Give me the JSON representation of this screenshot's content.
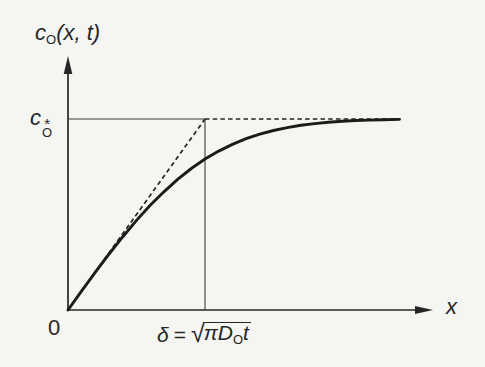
{
  "figure": {
    "colors": {
      "background": "#f5f5f2",
      "ink": "#262626",
      "thin_line": "#3d3d3d"
    }
  },
  "labels": {
    "y_axis": {
      "base": "c",
      "sub": "O",
      "args": "(x, t)"
    },
    "cstar": {
      "base": "c",
      "sup": "*",
      "sub": "O"
    },
    "origin": "0",
    "x_axis": "x",
    "delta": {
      "symbol": "δ",
      "equals": "=",
      "radical_sign": "√",
      "radicand_pre": "πD",
      "radicand_sub": "O",
      "radicand_post": "t"
    }
  },
  "chart_data": {
    "type": "line",
    "title": "",
    "xlabel": "x",
    "ylabel": "c_O(x, t)",
    "x_axis_units": "distance from electrode, in multiples of δ = √(πD_O t)",
    "y_axis_units": "concentration, fraction of bulk value c_O*",
    "xlim": [
      0,
      2.42
    ],
    "ylim": [
      0,
      1
    ],
    "grid": false,
    "legend": "none",
    "annotations": {
      "y_reference_level": {
        "label": "c_O*",
        "y": 1
      },
      "x_reference_level": {
        "label": "δ = √(πD_O t)",
        "x": 1
      }
    },
    "series": [
      {
        "id": "cstar-reference-line",
        "name": "bulk-concentration-level",
        "style": "thin-solid",
        "x": [
          0,
          1
        ],
        "y": [
          1,
          1
        ]
      },
      {
        "id": "delta-reference-line",
        "name": "delta-vertical-marker",
        "style": "thin-solid",
        "x": [
          1,
          1
        ],
        "y": [
          1,
          0
        ]
      },
      {
        "id": "tangent-dashed-line",
        "name": "linear-tangent-at-origin",
        "style": "dashed",
        "x": [
          0,
          1
        ],
        "y": [
          0,
          1
        ]
      },
      {
        "id": "bulk-level-dashed-line",
        "name": "bulk-asymptote",
        "style": "dashed",
        "x": [
          1,
          2.42
        ],
        "y": [
          1,
          1
        ]
      },
      {
        "id": "concentration-curve",
        "name": "erf-concentration-profile",
        "style": "thick-solid",
        "x": [
          0,
          0.1,
          0.2,
          0.3,
          0.4,
          0.5,
          0.6,
          0.7,
          0.8,
          0.9,
          1.0,
          1.1,
          1.2,
          1.3,
          1.4,
          1.5,
          1.6,
          1.7,
          1.8,
          1.9,
          2.0,
          2.1,
          2.2,
          2.3,
          2.42
        ],
        "y": [
          0,
          0.1,
          0.198,
          0.293,
          0.384,
          0.469,
          0.548,
          0.619,
          0.684,
          0.741,
          0.79,
          0.832,
          0.867,
          0.897,
          0.921,
          0.94,
          0.955,
          0.967,
          0.976,
          0.983,
          0.988,
          0.992,
          0.994,
          0.996,
          0.998
        ]
      }
    ]
  }
}
